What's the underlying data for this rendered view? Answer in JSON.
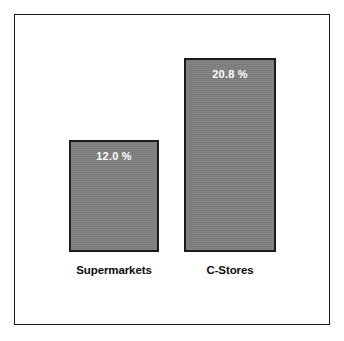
{
  "chart_data": {
    "type": "bar",
    "title": "",
    "subtitle": "",
    "xlabel": "",
    "ylabel": "",
    "categories": [
      "Supermarkets",
      "C-Stores"
    ],
    "values": [
      12.0,
      20.8
    ],
    "value_labels": [
      "12.0 %",
      "20.8 %"
    ],
    "units": "%",
    "ylim": [
      0,
      20.8
    ],
    "grid": false,
    "legend": null,
    "axis_visible": false,
    "series": [
      {
        "name": "",
        "values": [
          12.0,
          20.8
        ]
      }
    ],
    "annotations": []
  },
  "style": {
    "bar_fill": "#808080",
    "bar_border": "#1c1c1c",
    "value_label_color": "#ffffff",
    "category_label_color": "#0d0d0d",
    "frame_color": "#1a1a1a",
    "background": "#ffffff"
  }
}
